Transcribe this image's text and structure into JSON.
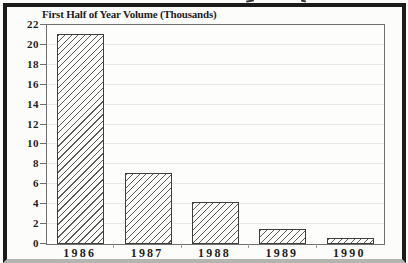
{
  "chart_data": {
    "type": "bar",
    "title": "First Half of Year Volume (Thousands)",
    "categories": [
      "1986",
      "1987",
      "1988",
      "1989",
      "1990"
    ],
    "values": [
      21.1,
      7.1,
      4.2,
      1.5,
      0.6
    ],
    "xlabel": "",
    "ylabel": "",
    "ylim": [
      0,
      22
    ],
    "ytick_step": 2,
    "grid": true,
    "legend": "none",
    "bar_style": "diagonal-hatch",
    "colors": {
      "outer_border": "#1b1b1b",
      "outer_border_bottom_faded": "#b4b4b1",
      "plot_frame": "#707070",
      "gridline": "#e7e7e3",
      "bar_outline": "#3e3e3e",
      "bar_hatch": "#4b4b4b",
      "text": "#1e1e1e",
      "background": "#fcfcfa"
    }
  }
}
